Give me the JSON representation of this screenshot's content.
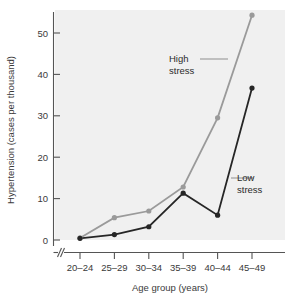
{
  "chart_data": {
    "type": "line",
    "title": "",
    "xlabel": "Age group (years)",
    "ylabel": "Hypertension (cases per thousand)",
    "categories": [
      "20–24",
      "25–29",
      "30–34",
      "35–39",
      "40–44",
      "45–49"
    ],
    "yticks": [
      0,
      10,
      20,
      30,
      40,
      50
    ],
    "ylim": [
      0,
      56
    ],
    "grid": false,
    "legend_position": "inline-annotations",
    "axis_break_x": true,
    "series": [
      {
        "name": "High stress",
        "color": "#9a9a9a",
        "values": [
          0.5,
          5.4,
          7.0,
          12.8,
          29.5,
          54.3
        ]
      },
      {
        "name": "Low stress",
        "color": "#262626",
        "values": [
          0.4,
          1.3,
          3.2,
          11.3,
          6.0,
          36.7
        ]
      }
    ],
    "annotations": [
      {
        "text_line1": "High",
        "text_line2": "stress",
        "target_series": "High stress"
      },
      {
        "text_line1": "Low",
        "text_line2": "stress",
        "target_series": "Low stress"
      }
    ]
  },
  "axes": {
    "y_title": "Hypertension (cases per thousand)",
    "x_title": "Age group (years)",
    "y_tick_labels": [
      "0",
      "10",
      "20",
      "30",
      "40",
      "50"
    ],
    "x_tick_labels": [
      "20–24",
      "25–29",
      "30–34",
      "35–39",
      "40–44",
      "45–49"
    ]
  },
  "labels": {
    "high_stress_line1": "High",
    "high_stress_line2": "stress",
    "low_stress_line1": "Low",
    "low_stress_line2": "stress"
  },
  "colors": {
    "high_stress": "#9a9a9a",
    "low_stress": "#262626",
    "plot_background": "#f0f0f0",
    "axis": "#555555",
    "text": "#3a3a3a"
  }
}
